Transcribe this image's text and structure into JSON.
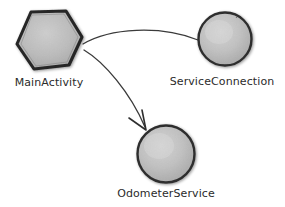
{
  "diagram": {
    "style": "hand-drawn sketch",
    "background_color": "#ffffff",
    "node_fill_color": "#c2c2c2",
    "node_highlight_color": "#d8d8d8",
    "node_outline_color": "#2a2a2a",
    "edge_color": "#3a3a3a",
    "label_color": "#2b2b2b",
    "nodes": [
      {
        "id": "main-activity",
        "label": "MainActivity",
        "shape": "hexagon",
        "cx": 49,
        "cy": 41,
        "rx": 34,
        "ry": 31,
        "label_x": 49,
        "label_y": 83
      },
      {
        "id": "service-connection",
        "label": "ServiceConnection",
        "shape": "circle",
        "cx": 225,
        "cy": 39,
        "rx": 27,
        "ry": 27,
        "label_x": 222,
        "label_y": 82
      },
      {
        "id": "odometer-service",
        "label": "OdometerService",
        "shape": "circle",
        "cx": 166,
        "cy": 154,
        "rx": 29,
        "ry": 29,
        "label_x": 166,
        "label_y": 194
      }
    ],
    "edges": [
      {
        "id": "edge-main-to-serviceconnection",
        "from": "main-activity",
        "to": "service-connection",
        "arrow": false,
        "path": "M 83,44 C 110,28 160,25 198,40"
      },
      {
        "id": "edge-main-to-odometerservice",
        "from": "main-activity",
        "to": "odometer-service",
        "arrow": true,
        "path": "M 84,50 C 104,62 130,92 145,127",
        "arrowhead": "M 129,118 L 146,130 L 142,110"
      }
    ]
  }
}
